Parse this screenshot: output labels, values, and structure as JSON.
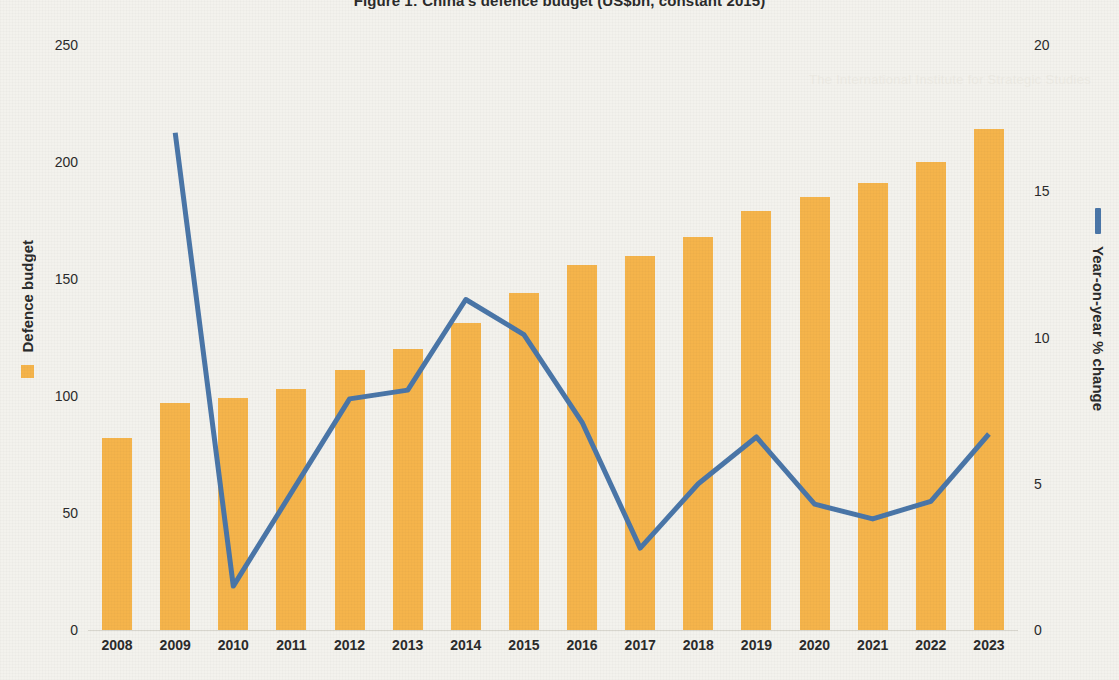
{
  "chart_title": "Figure 1: China's defence budget (US$bn, constant 2015)",
  "watermark": "The International Institute for Strategic Studies",
  "colors": {
    "bar": "#F5B44B",
    "line": "#4A76A8",
    "background": "#F3F2ED",
    "text": "#2B2B2B",
    "axis": "#D8D6CE"
  },
  "legend": {
    "bar_label": "Defence budget",
    "bar_marker": "orange-square",
    "line_label": "Year-on-year % change",
    "line_marker": "blue-bar"
  },
  "chart_data": {
    "type": "bar",
    "title": "Figure 1: China's defence budget (US$bn, constant 2015)",
    "xlabel": "",
    "ylabel": "Defence budget",
    "y2label": "Year-on-year % change",
    "ylim": [
      0,
      250
    ],
    "y2lim": [
      0,
      20
    ],
    "yticks": [
      "0",
      "50",
      "100",
      "150",
      "200",
      "250"
    ],
    "ytick_values": [
      0,
      50,
      100,
      150,
      200,
      250
    ],
    "y2ticks": [
      "0",
      "5",
      "10",
      "15",
      "20"
    ],
    "y2tick_values": [
      0,
      5,
      10,
      15,
      20
    ],
    "grid": false,
    "legend_position": "left-and-right-margins",
    "categories": [
      "2008",
      "2009",
      "2010",
      "2011",
      "2012",
      "2013",
      "2014",
      "2015",
      "2016",
      "2017",
      "2018",
      "2019",
      "2020",
      "2021",
      "2022",
      "2023"
    ],
    "series": [
      {
        "name": "Defence budget",
        "type": "bar",
        "axis": "left",
        "color": "#F5B44B",
        "values": [
          82,
          97,
          99,
          103,
          111,
          120,
          131,
          144,
          156,
          160,
          168,
          179,
          185,
          191,
          200,
          214
        ]
      },
      {
        "name": "Year-on-year % change",
        "type": "line",
        "axis": "right",
        "color": "#4A76A8",
        "values": [
          null,
          17.0,
          1.5,
          null,
          7.9,
          8.2,
          11.3,
          10.1,
          7.1,
          2.8,
          5.0,
          6.6,
          4.3,
          3.8,
          4.4,
          6.7
        ]
      }
    ]
  }
}
